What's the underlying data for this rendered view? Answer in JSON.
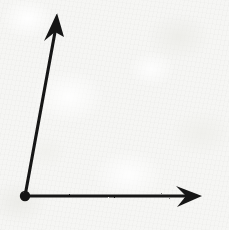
{
  "figure": {
    "kind": "hand-drawn-angle-diagram",
    "medium": "ink on textured paper",
    "canvas": {
      "width": 229,
      "height": 230
    },
    "colors": {
      "ink": "#171717",
      "ink_soft": "#2a2a28",
      "paper": "#f6f6f4",
      "paper_highlight": "#ffffff",
      "paper_shadow": "#eaeae6"
    },
    "vertex": {
      "label": "vertex",
      "x": 25,
      "y": 196,
      "radius": 5.2
    },
    "rays": [
      {
        "id": "ray-up",
        "label": "upward ray",
        "from": {
          "x": 25,
          "y": 196
        },
        "to": {
          "x": 57,
          "y": 13
        },
        "stroke_width": 3.1,
        "direction_degrees": 80.1,
        "arrowhead": {
          "label": "up-arrowhead",
          "tip": {
            "x": 57,
            "y": 13
          },
          "left_barb": {
            "x": 44,
            "y": 41
          },
          "right_barb": {
            "x": 64,
            "y": 37
          },
          "notch": {
            "x": 55,
            "y": 32
          },
          "style": "barbed-concave"
        }
      },
      {
        "id": "ray-right",
        "label": "rightward ray",
        "from": {
          "x": 25,
          "y": 196
        },
        "to": {
          "x": 202,
          "y": 196
        },
        "stroke_width": 3.1,
        "direction_degrees": 0,
        "arrowhead": {
          "label": "right-arrowhead",
          "tip": {
            "x": 202,
            "y": 196
          },
          "left_barb": {
            "x": 176,
            "y": 186
          },
          "right_barb": {
            "x": 177,
            "y": 207
          },
          "notch": {
            "x": 186,
            "y": 196
          },
          "style": "barbed-concave"
        }
      }
    ],
    "angle": {
      "label": "interior angle at vertex",
      "value_degrees": 80,
      "between": [
        "ray-right",
        "ray-up"
      ]
    }
  }
}
